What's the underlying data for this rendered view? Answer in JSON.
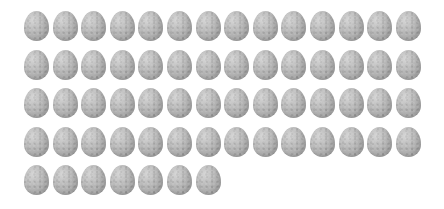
{
  "image": {
    "description": "Grid of grey speckled eggs",
    "egg_color": "#b3b3b3",
    "background": "#ffffff",
    "total_count": 63,
    "rows": [
      {
        "count": 14
      },
      {
        "count": 14
      },
      {
        "count": 14
      },
      {
        "count": 14
      },
      {
        "count": 7
      }
    ],
    "layout": {
      "origin_x": 24,
      "origin_y": 11,
      "col_spacing": 28.6,
      "row_spacing": 38.5
    }
  }
}
